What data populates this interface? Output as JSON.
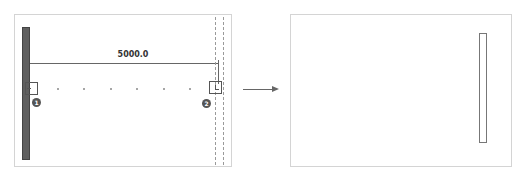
{
  "diagram": {
    "before_panel": {
      "dimension_label": "5000.0",
      "nodes": [
        {
          "id": 1,
          "badge": "1"
        },
        {
          "id": 2,
          "badge": "2"
        }
      ],
      "intermediate_points": 6
    },
    "transition": {
      "arrow": "right-arrow"
    },
    "after_panel": {
      "shape": "vertical-rectangle"
    }
  }
}
